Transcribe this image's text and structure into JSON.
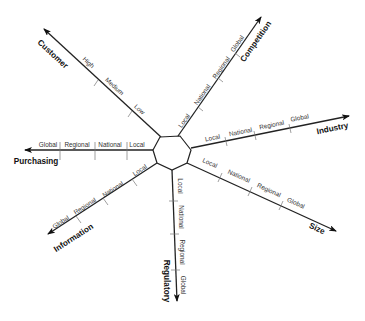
{
  "diagram": {
    "type": "radial-axis-diagram",
    "center_shape": "octagon",
    "axes": [
      {
        "id": "customer",
        "label": "Customer",
        "levels": [
          "Low",
          "Medium",
          "High"
        ],
        "direction": "upper-left"
      },
      {
        "id": "competition",
        "label": "Competition",
        "levels": [
          "Local",
          "National",
          "Regional",
          "Global"
        ],
        "direction": "upper-right"
      },
      {
        "id": "industry",
        "label": "Industry",
        "levels": [
          "Local",
          "National",
          "Regional",
          "Global"
        ],
        "direction": "right"
      },
      {
        "id": "size",
        "label": "Size",
        "levels": [
          "Local",
          "National",
          "Regional",
          "Global"
        ],
        "direction": "lower-right"
      },
      {
        "id": "regulatory",
        "label": "Regulatory",
        "levels": [
          "Local",
          "National",
          "Regional",
          "Global"
        ],
        "direction": "down"
      },
      {
        "id": "information",
        "label": "Information",
        "levels": [
          "Local",
          "National",
          "Regional",
          "Global"
        ],
        "direction": "lower-left"
      },
      {
        "id": "purchasing",
        "label": "Purchasing",
        "levels": [
          "Local",
          "National",
          "Regional",
          "Global"
        ],
        "direction": "left"
      }
    ],
    "colors": {
      "axis": "#222222",
      "tick": "#777777",
      "text": "#333333",
      "background": "#ffffff"
    }
  }
}
